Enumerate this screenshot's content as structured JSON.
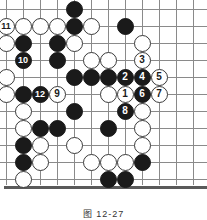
{
  "figure": {
    "caption": "图 12-27",
    "type": "go-board-diagram",
    "board": {
      "cols": 12,
      "rows": 11,
      "origin_x": 6,
      "origin_y": 9,
      "spacing": 17,
      "stone_size": 17,
      "line_color": "#8a8a8a",
      "edge_color": "#5a5a5a",
      "black_color": "#1a1a1a",
      "white_color": "#ffffff"
    },
    "stones": [
      {
        "col": 5,
        "row": 1,
        "color": "black",
        "label": ""
      },
      {
        "col": 1,
        "row": 2,
        "color": "white",
        "label": "11"
      },
      {
        "col": 2,
        "row": 2,
        "color": "white",
        "label": ""
      },
      {
        "col": 3,
        "row": 2,
        "color": "white",
        "label": ""
      },
      {
        "col": 4,
        "row": 2,
        "color": "white",
        "label": ""
      },
      {
        "col": 5,
        "row": 2,
        "color": "black",
        "label": ""
      },
      {
        "col": 6,
        "row": 2,
        "color": "white",
        "label": ""
      },
      {
        "col": 8,
        "row": 2,
        "color": "black",
        "label": ""
      },
      {
        "col": 1,
        "row": 3,
        "color": "white",
        "label": ""
      },
      {
        "col": 2,
        "row": 3,
        "color": "black",
        "label": ""
      },
      {
        "col": 4,
        "row": 3,
        "color": "black",
        "label": ""
      },
      {
        "col": 5,
        "row": 3,
        "color": "white",
        "label": ""
      },
      {
        "col": 9,
        "row": 3,
        "color": "white",
        "label": ""
      },
      {
        "col": 2,
        "row": 4,
        "color": "black",
        "label": "10"
      },
      {
        "col": 4,
        "row": 4,
        "color": "black",
        "label": ""
      },
      {
        "col": 6,
        "row": 4,
        "color": "white",
        "label": ""
      },
      {
        "col": 7,
        "row": 4,
        "color": "white",
        "label": ""
      },
      {
        "col": 9,
        "row": 4,
        "color": "white",
        "label": "3"
      },
      {
        "col": 1,
        "row": 5,
        "color": "white",
        "label": ""
      },
      {
        "col": 5,
        "row": 5,
        "color": "black",
        "label": ""
      },
      {
        "col": 6,
        "row": 5,
        "color": "black",
        "label": ""
      },
      {
        "col": 7,
        "row": 5,
        "color": "black",
        "label": ""
      },
      {
        "col": 8,
        "row": 5,
        "color": "black",
        "label": "2"
      },
      {
        "col": 9,
        "row": 5,
        "color": "black",
        "label": "4"
      },
      {
        "col": 10,
        "row": 5,
        "color": "white",
        "label": "5"
      },
      {
        "col": 1,
        "row": 6,
        "color": "white",
        "label": ""
      },
      {
        "col": 2,
        "row": 6,
        "color": "black",
        "label": ""
      },
      {
        "col": 3,
        "row": 6,
        "color": "black",
        "label": "12"
      },
      {
        "col": 4,
        "row": 6,
        "color": "white",
        "label": "9"
      },
      {
        "col": 7,
        "row": 6,
        "color": "white",
        "label": ""
      },
      {
        "col": 8,
        "row": 6,
        "color": "white",
        "label": "1"
      },
      {
        "col": 9,
        "row": 6,
        "color": "black",
        "label": "6"
      },
      {
        "col": 10,
        "row": 6,
        "color": "white",
        "label": "7"
      },
      {
        "col": 2,
        "row": 7,
        "color": "white",
        "label": ""
      },
      {
        "col": 5,
        "row": 7,
        "color": "black",
        "label": ""
      },
      {
        "col": 8,
        "row": 7,
        "color": "black",
        "label": "8"
      },
      {
        "col": 9,
        "row": 7,
        "color": "white",
        "label": ""
      },
      {
        "col": 2,
        "row": 8,
        "color": "white",
        "label": ""
      },
      {
        "col": 3,
        "row": 8,
        "color": "black",
        "label": ""
      },
      {
        "col": 4,
        "row": 8,
        "color": "black",
        "label": ""
      },
      {
        "col": 7,
        "row": 8,
        "color": "black",
        "label": ""
      },
      {
        "col": 9,
        "row": 8,
        "color": "white",
        "label": ""
      },
      {
        "col": 2,
        "row": 9,
        "color": "black",
        "label": ""
      },
      {
        "col": 3,
        "row": 9,
        "color": "white",
        "label": ""
      },
      {
        "col": 5,
        "row": 9,
        "color": "white",
        "label": ""
      },
      {
        "col": 9,
        "row": 9,
        "color": "white",
        "label": ""
      },
      {
        "col": 2,
        "row": 10,
        "color": "black",
        "label": ""
      },
      {
        "col": 3,
        "row": 10,
        "color": "white",
        "label": ""
      },
      {
        "col": 6,
        "row": 10,
        "color": "white",
        "label": ""
      },
      {
        "col": 7,
        "row": 10,
        "color": "white",
        "label": ""
      },
      {
        "col": 8,
        "row": 10,
        "color": "white",
        "label": ""
      },
      {
        "col": 9,
        "row": 10,
        "color": "black",
        "label": ""
      },
      {
        "col": 2,
        "row": 11,
        "color": "white",
        "label": ""
      },
      {
        "col": 7,
        "row": 11,
        "color": "black",
        "label": ""
      },
      {
        "col": 8,
        "row": 11,
        "color": "black",
        "label": ""
      }
    ]
  }
}
